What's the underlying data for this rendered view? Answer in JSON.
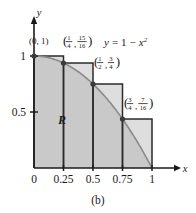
{
  "figure": {
    "caption": "(b)",
    "region_label": "R",
    "equation": "y = 1 − x²",
    "equation_parts": {
      "lhs": "y",
      "eq": "=",
      "one": "1",
      "minus": "−",
      "x": "x",
      "exp": "2"
    },
    "colors": {
      "region_fill": "#c9c9c9",
      "overshoot_fill": "#dedede",
      "axis": "#1a1a1a",
      "curve": "#8a8a8a",
      "rect_stroke": "#2b2b2b",
      "dot": "#3a3a3a",
      "background": "#ffffff"
    }
  },
  "axes": {
    "x": {
      "name": "x",
      "tick_labels": [
        "0",
        "0.25",
        "0.5",
        "0.75",
        "1"
      ],
      "tick_values": [
        0,
        0.25,
        0.5,
        0.75,
        1
      ],
      "range": [
        0,
        1
      ]
    },
    "y": {
      "name": "y",
      "tick_labels": [
        "0.5",
        "1"
      ],
      "tick_values": [
        0.5,
        1
      ],
      "range": [
        0,
        1.12
      ]
    }
  },
  "chart_data": {
    "type": "area",
    "title": "(b)",
    "xlabel": "x",
    "ylabel": "y",
    "xlim": [
      0,
      1
    ],
    "ylim": [
      0,
      1.12
    ],
    "grid": false,
    "legend": "none",
    "function": "y = 1 - x^2",
    "region_label": "R",
    "curve": {
      "name": "y = 1 - x²",
      "x": [
        0,
        0.125,
        0.25,
        0.375,
        0.5,
        0.625,
        0.75,
        0.875,
        1
      ],
      "y": [
        1,
        0.984375,
        0.9375,
        0.859375,
        0.75,
        0.609375,
        0.4375,
        0.234375,
        0
      ]
    },
    "rectangles": {
      "type": "bar",
      "method": "left-endpoint (circumscribed)",
      "n": 4,
      "width": 0.25,
      "categories": [
        "[0, 0.25]",
        "[0.25, 0.5]",
        "[0.5, 0.75]",
        "[0.75, 1]"
      ],
      "left_endpoints": [
        0,
        0.25,
        0.5,
        0.75
      ],
      "values": [
        1,
        0.9375,
        0.75,
        0.4375
      ]
    },
    "annotations": [
      {
        "id": "pt-0",
        "x": 0,
        "y": 1,
        "text": "(0, 1)",
        "open": "(",
        "close": ")",
        "xnum": "0",
        "ynum": "1",
        "kind": "plain",
        "label_x": 29,
        "label_y": 44
      },
      {
        "id": "pt-1",
        "x": 0.25,
        "y": 0.9375,
        "text": "(1/4, 15/16)",
        "open": "(",
        "close": ")",
        "xn": "1",
        "xd": "4",
        "yn": "15",
        "yd": "16",
        "kind": "fraction",
        "label_x": 63,
        "label_y": 41
      },
      {
        "id": "pt-2",
        "x": 0.5,
        "y": 0.75,
        "text": "(1/2, 3/4)",
        "open": "(",
        "close": ")",
        "xn": "1",
        "xd": "2",
        "yn": "3",
        "yd": "4",
        "kind": "fraction",
        "label_x": 94,
        "label_y": 62
      },
      {
        "id": "pt-3",
        "x": 0.75,
        "y": 0.4375,
        "text": "(3/4, 7/16)",
        "open": "(",
        "close": ")",
        "xn": "3",
        "xd": "4",
        "yn": "7",
        "yd": "16",
        "kind": "fraction",
        "label_x": 124,
        "label_y": 103
      }
    ]
  }
}
